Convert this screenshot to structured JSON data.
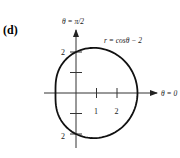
{
  "figure": {
    "panel_label": "(d)",
    "vertical_axis_label": "θ = π/2",
    "horizontal_axis_label": "θ = 0",
    "curve_label": "r = cosθ − 2",
    "x_ticks": [
      {
        "value": 1,
        "label": "1"
      },
      {
        "value": 2,
        "label": "2"
      }
    ],
    "y_ticks": [
      {
        "value": 2,
        "label": "2"
      },
      {
        "value": 1,
        "label": ""
      },
      {
        "value": -1,
        "label": ""
      },
      {
        "value": -2,
        "label": "2"
      }
    ],
    "colors": {
      "curve": "#111111",
      "axis": "#333333",
      "background": "#ffffff"
    }
  },
  "chart_data": {
    "type": "line",
    "title": "(d)",
    "equation": "r = cos(theta) - 2",
    "xlabel": "θ = 0",
    "ylabel": "θ = π/2",
    "x_ticks": [
      1,
      2
    ],
    "y_ticks": [
      2,
      1,
      -1,
      -2
    ],
    "xlim": [
      -1.6,
      3.9
    ],
    "ylim": [
      -2.7,
      3.0
    ],
    "key_points": [
      {
        "theta": "0",
        "r": -1,
        "x": -1,
        "y": 0
      },
      {
        "theta": "π/2",
        "r": -2,
        "x": 0,
        "y": -2
      },
      {
        "theta": "π",
        "r": -3,
        "x": 3,
        "y": 0
      },
      {
        "theta": "3π/2",
        "r": -2,
        "x": 0,
        "y": 2
      }
    ],
    "grid": false,
    "legend": "none"
  }
}
